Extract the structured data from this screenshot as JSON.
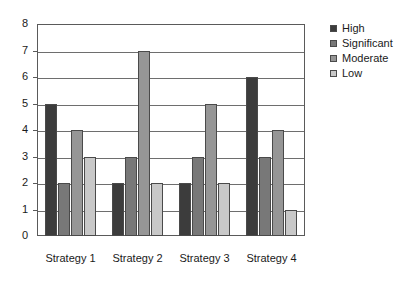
{
  "chart_data": {
    "type": "bar",
    "title": "",
    "subtitle": "",
    "xlabel": "",
    "ylabel": "",
    "categories": [
      "Strategy 1",
      "Strategy 2",
      "Strategy 3",
      "Strategy 4"
    ],
    "series": [
      {
        "name": "High",
        "values": [
          5,
          2,
          2,
          6
        ],
        "color": "#3c3c3c"
      },
      {
        "name": "Significant",
        "values": [
          2,
          3,
          3,
          3
        ],
        "color": "#787878"
      },
      {
        "name": "Moderate",
        "values": [
          4,
          7,
          5,
          4
        ],
        "color": "#969696"
      },
      {
        "name": "Low",
        "values": [
          3,
          2,
          2,
          1
        ],
        "color": "#c8c8c8"
      }
    ],
    "ylim": [
      0,
      8
    ],
    "y_ticks": [
      0,
      1,
      2,
      3,
      4,
      5,
      6,
      7,
      8
    ],
    "y_tick_labels": [
      "0",
      "1",
      "2",
      "3",
      "4",
      "5",
      "6",
      "7",
      "8"
    ],
    "grid": true,
    "grid_axis": "y",
    "legend": true,
    "legend_position": "right",
    "bar_border_color": "#4a4a4a",
    "axis_color": "#5a5a5a",
    "gridline_color": "#6e6e6e",
    "background_color": "#ffffff"
  }
}
